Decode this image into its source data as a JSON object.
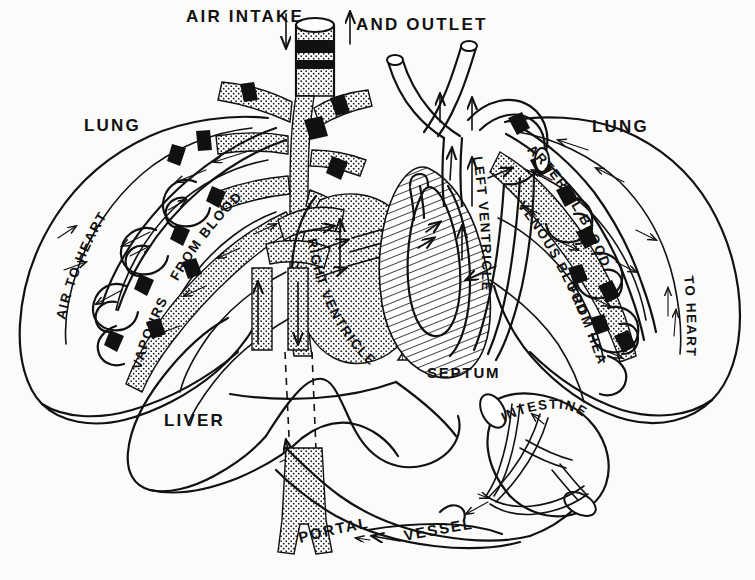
{
  "figure": {
    "kind": "anatomical-diagram",
    "width": 755,
    "height": 580,
    "background_color": "#fbfbfa",
    "ink_color": "#111111"
  },
  "labels": {
    "air_intake": "AIR INTAKE",
    "and_outlet": "AND OUTLET",
    "lung_left": "LUNG",
    "lung_right": "LUNG",
    "air_to_heart": "AIR TO HEART",
    "vapours": "VAPOURS",
    "from_blood": "FROM BLOOD",
    "arterial_blood": "ARTERIAL BLOOD",
    "to_heart": "TO HEART",
    "venous_blood": "VENOUS BLOOD",
    "from_heart": "FROM HEART",
    "right_ventricle": "RIGHT VENTRICLE",
    "left_ventricle": "LEFT VENTRICLE",
    "septum": "SEPTUM",
    "liver": "LIVER",
    "intestine": "INTESTINE",
    "portal": "PORTAL",
    "vessel": "VESSEL"
  },
  "structures": [
    {
      "name": "trachea",
      "label": "AIR INTAKE AND OUTLET",
      "fill": "stipple"
    },
    {
      "name": "left-lung",
      "label": "LUNG",
      "fill": "none"
    },
    {
      "name": "right-lung",
      "label": "LUNG",
      "fill": "none"
    },
    {
      "name": "right-ventricle",
      "label": "RIGHT VENTRICLE",
      "fill": "stipple"
    },
    {
      "name": "left-ventricle",
      "label": "LEFT VENTRICLE",
      "fill": "hatch"
    },
    {
      "name": "septum",
      "label": "SEPTUM",
      "fill": "vertical-hatch"
    },
    {
      "name": "liver",
      "label": "LIVER",
      "fill": "none"
    },
    {
      "name": "intestine",
      "label": "INTESTINE",
      "fill": "none"
    },
    {
      "name": "portal-vessel",
      "label": "PORTAL VESSEL",
      "fill": "stipple"
    }
  ]
}
